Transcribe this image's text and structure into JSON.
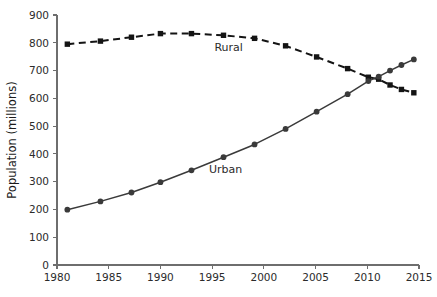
{
  "chart_data": {
    "type": "line",
    "title": "",
    "xlabel": "",
    "ylabel": "Population (millions)",
    "xlim": [
      1980,
      2015
    ],
    "ylim": [
      0,
      900
    ],
    "xticks": [
      1980,
      1985,
      1990,
      1995,
      2000,
      2005,
      2010,
      2015
    ],
    "yticks": [
      0,
      100,
      200,
      300,
      400,
      500,
      600,
      700,
      800,
      900
    ],
    "grid": false,
    "legend_position": "inline-annotation",
    "series": [
      {
        "name": "Rural",
        "marker": "square",
        "linestyle": "dashed",
        "color": "#141414",
        "label_x": 1996.6,
        "label_y": 770,
        "points": [
          {
            "x": 1981.0,
            "y": 795
          },
          {
            "x": 1984.2,
            "y": 806
          },
          {
            "x": 1987.2,
            "y": 820
          },
          {
            "x": 1990.0,
            "y": 833
          },
          {
            "x": 1993.0,
            "y": 833
          },
          {
            "x": 1996.1,
            "y": 827
          },
          {
            "x": 1999.1,
            "y": 816
          },
          {
            "x": 2002.1,
            "y": 789
          },
          {
            "x": 2005.1,
            "y": 749
          },
          {
            "x": 2008.1,
            "y": 707
          },
          {
            "x": 2010.1,
            "y": 676
          },
          {
            "x": 2011.1,
            "y": 669
          },
          {
            "x": 2012.2,
            "y": 648
          },
          {
            "x": 2013.3,
            "y": 632
          },
          {
            "x": 2014.5,
            "y": 620
          }
        ]
      },
      {
        "name": "Urban",
        "marker": "circle",
        "linestyle": "solid",
        "color": "#3a3a3a",
        "label_x": 1996.3,
        "label_y": 330,
        "points": [
          {
            "x": 1981.0,
            "y": 199
          },
          {
            "x": 1984.2,
            "y": 229
          },
          {
            "x": 1987.2,
            "y": 261
          },
          {
            "x": 1990.0,
            "y": 298
          },
          {
            "x": 1993.0,
            "y": 341
          },
          {
            "x": 1996.1,
            "y": 388
          },
          {
            "x": 1999.1,
            "y": 434
          },
          {
            "x": 2002.1,
            "y": 490
          },
          {
            "x": 2005.1,
            "y": 552
          },
          {
            "x": 2008.1,
            "y": 615
          },
          {
            "x": 2010.1,
            "y": 662
          },
          {
            "x": 2011.1,
            "y": 678
          },
          {
            "x": 2012.2,
            "y": 700
          },
          {
            "x": 2013.3,
            "y": 720
          },
          {
            "x": 2014.5,
            "y": 740
          }
        ]
      }
    ]
  }
}
